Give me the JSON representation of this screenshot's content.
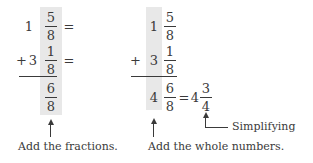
{
  "left_panel": {
    "row1": {
      "whole": "1",
      "numerator": "5",
      "denominator": "8",
      "equals": "="
    },
    "row2": {
      "operator": "+",
      "whole": "3",
      "numerator": "1",
      "denominator": "8",
      "equals": "="
    },
    "result": {
      "numerator": "6",
      "denominator": "8"
    },
    "caption": "Add the fractions."
  },
  "right_panel": {
    "row1": {
      "whole": "1",
      "numerator": "5",
      "denominator": "8"
    },
    "row2": {
      "operator": "+",
      "whole": "3",
      "numerator": "1",
      "denominator": "8"
    },
    "result": {
      "whole": "4",
      "numerator": "6",
      "denominator": "8",
      "equals": "="
    },
    "simplified": {
      "whole": "4",
      "numerator": "3",
      "denominator": "4"
    },
    "caption_whole": "Add the whole numbers.",
    "caption_simplify": "Simplifying"
  },
  "colors": {
    "highlight": "#e8e8e8",
    "text": "#3a3a3a"
  }
}
